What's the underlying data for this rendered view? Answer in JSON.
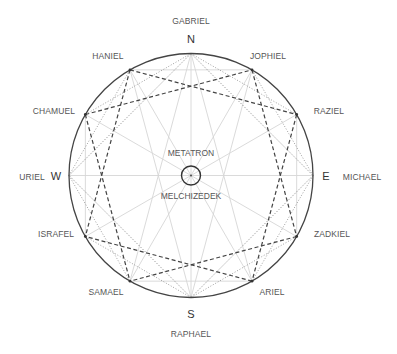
{
  "diagram": {
    "type": "twelve-point compass wheel",
    "center": {
      "above_label": "METATRON",
      "below_label": "MELCHIZEDEK"
    },
    "cardinals": [
      {
        "letter": "N",
        "angle_deg": 0,
        "name": "GABRIEL"
      },
      {
        "letter": "E",
        "angle_deg": 90,
        "name": "MICHAEL"
      },
      {
        "letter": "S",
        "angle_deg": 180,
        "name": "RAPHAEL"
      },
      {
        "letter": "W",
        "angle_deg": 270,
        "name": "URIEL"
      }
    ],
    "points": [
      {
        "name": "JOPHIEL",
        "angle_deg": 30
      },
      {
        "name": "RAZIEL",
        "angle_deg": 60
      },
      {
        "name": "ZADKIEL",
        "angle_deg": 120
      },
      {
        "name": "ARIEL",
        "angle_deg": 150
      },
      {
        "name": "SAMAEL",
        "angle_deg": 210
      },
      {
        "name": "ISRAFEL",
        "angle_deg": 240
      },
      {
        "name": "CHAMUEL",
        "angle_deg": 300
      },
      {
        "name": "HANIEL",
        "angle_deg": 330
      }
    ],
    "connections": {
      "dashed_star": [
        [
          "HANIEL",
          "RAZIEL"
        ],
        [
          "HANIEL",
          "ISRAFEL"
        ],
        [
          "CHAMUEL",
          "JOPHIEL"
        ],
        [
          "CHAMUEL",
          "SAMAEL"
        ],
        [
          "JOPHIEL",
          "ZADKIEL"
        ],
        [
          "RAZIEL",
          "ARIEL"
        ],
        [
          "ZADKIEL",
          "SAMAEL"
        ],
        [
          "ARIEL",
          "ISRAFEL"
        ]
      ],
      "dotted_square": [
        [
          "N",
          "E"
        ],
        [
          "E",
          "S"
        ],
        [
          "S",
          "W"
        ],
        [
          "W",
          "N"
        ]
      ],
      "dotted_extra": [
        [
          "N",
          "CHAMUEL"
        ],
        [
          "N",
          "RAZIEL"
        ],
        [
          "S",
          "ISRAFEL"
        ],
        [
          "S",
          "ZADKIEL"
        ],
        [
          "E",
          "JOPHIEL"
        ],
        [
          "E",
          "ARIEL"
        ],
        [
          "W",
          "HANIEL"
        ],
        [
          "W",
          "SAMAEL"
        ]
      ],
      "light_chords": [
        [
          "HANIEL",
          "JOPHIEL"
        ],
        [
          "RAZIEL",
          "ZADKIEL"
        ],
        [
          "ARIEL",
          "SAMAEL"
        ],
        [
          "ISRAFEL",
          "CHAMUEL"
        ],
        [
          "N",
          "SAMAEL"
        ],
        [
          "N",
          "ARIEL"
        ],
        [
          "S",
          "HANIEL"
        ],
        [
          "S",
          "JOPHIEL"
        ]
      ],
      "spokes": "center to all 12 points"
    },
    "colors": {
      "circle": "#444444",
      "dashed": "#444444",
      "dotted": "#777777",
      "light": "#d6d6d6"
    }
  }
}
